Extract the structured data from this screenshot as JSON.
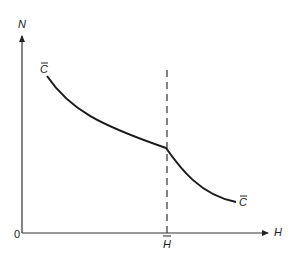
{
  "diagram": {
    "y_axis_label": "N",
    "x_axis_label": "H",
    "origin_label": "0",
    "threshold_label": "H",
    "curve_start_label": "C",
    "curve_end_label": "C",
    "colors": {
      "line": "#1a1a1a",
      "axis": "#333333"
    }
  }
}
